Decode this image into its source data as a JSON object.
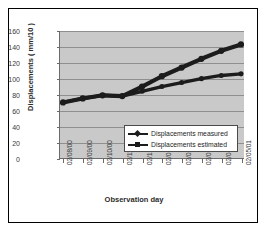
{
  "chart_data": {
    "type": "line",
    "title": "",
    "xlabel": "Observation day",
    "ylabel": "Displacements ( mm/10 )",
    "ylim": [
      0,
      160
    ],
    "ytick_step": 20,
    "yticks": [
      "160",
      "140",
      "120",
      "100",
      "80",
      "60",
      "40",
      "20",
      "0"
    ],
    "grid": true,
    "legend_position": "center",
    "categories": [
      "02/08/00",
      "02/09/00",
      "02/10/00",
      "02/11/00",
      "02/12/00",
      "02/01/01",
      "02/02/01",
      "02/03/01",
      "02/04/01",
      "02/05/01"
    ],
    "series": [
      {
        "name": "Displacements measured",
        "marker": "diamond",
        "color": "#1c1c1c",
        "values": [
          70,
          75,
          79,
          78,
          84,
          90,
          95,
          100,
          104,
          106
        ]
      },
      {
        "name": "Displacements estimated",
        "marker": "square",
        "color": "#1c1c1c",
        "values": [
          70,
          75,
          79,
          78,
          90,
          103,
          114,
          125,
          135,
          143
        ]
      }
    ],
    "colors": {
      "plot_background": "#c9c9c9",
      "gridline": "#8f8f8f",
      "axis": "#6b6b6b",
      "text": "#3a3a3a",
      "series": "#1c1c1c",
      "figure_border": "#000000",
      "figure_background": "#ffffff"
    }
  },
  "legend": {
    "items": [
      {
        "label": "Displacements measured"
      },
      {
        "label": "Displacements estimated"
      }
    ]
  }
}
